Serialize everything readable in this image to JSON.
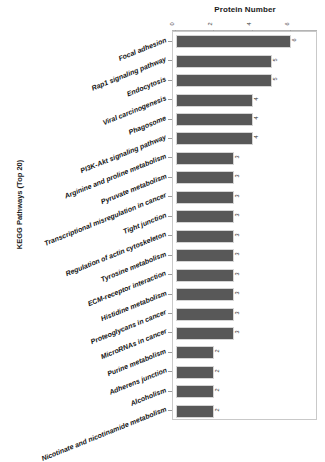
{
  "chart_data": {
    "type": "bar",
    "orientation": "horizontal",
    "title": "Protein Number",
    "xlabel": "Protein Number",
    "ylabel": "KEGG Pathways (Top 20)",
    "xlim": [
      0,
      7.25
    ],
    "xticks": [
      0,
      2,
      4,
      6
    ],
    "xticklabels": [
      "0",
      "2",
      "4",
      "6"
    ],
    "grid": false,
    "legend": null,
    "bar_color": "#585858",
    "categories": [
      "Focal adhesion",
      "Rap1 signaling pathway",
      "Endocytosis",
      "Viral carcinogenesis",
      "Phagosome",
      "PI3K-Akt signaling pathway",
      "Arginine and proline metabolism",
      "Pyruvate metabolism",
      "Transcriptional misregulation in cancer",
      "Tight junction",
      "Regulation of actin cytoskeleton",
      "Tyrosine metabolism",
      "ECM-receptor interaction",
      "Histidine metabolism",
      "Proteoglycans in cancer",
      "MicroRNAs in cancer",
      "Purine metabolism",
      "Adherens junction",
      "Alcoholism",
      "Nicotinate and nicotinamide metabolism"
    ],
    "values": [
      6,
      5,
      5,
      4,
      4,
      4,
      3,
      3,
      3,
      3,
      3,
      3,
      3,
      3,
      3,
      3,
      2,
      2,
      2,
      2
    ],
    "value_labels": [
      "6",
      "5",
      "5",
      "4",
      "4",
      "4",
      "3",
      "3",
      "3",
      "3",
      "3",
      "3",
      "3",
      "3",
      "3",
      "3",
      "2",
      "2",
      "2",
      "2"
    ]
  },
  "axes": {
    "title": "Protein Number",
    "y_axis_title": "KEGG Pathways (Top 20)"
  }
}
